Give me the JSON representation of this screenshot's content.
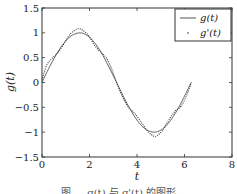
{
  "chart_data": {
    "type": "line",
    "title": "",
    "xlabel": "t",
    "ylabel": "g(t)",
    "xlim": [
      0,
      8
    ],
    "ylim": [
      -1.5,
      1.5
    ],
    "xticks": [
      0,
      2,
      4,
      6,
      8
    ],
    "xtick_labels": [
      "0",
      "2",
      "4",
      "6",
      "8"
    ],
    "yticks": [
      -1.5,
      -1,
      -0.5,
      0,
      0.5,
      1,
      1.5
    ],
    "ytick_labels": [
      "−1.5",
      "−1",
      "−0.5",
      "0",
      "0.5",
      "1",
      "1.5"
    ],
    "grid": false,
    "legend_position": "upper right",
    "series": [
      {
        "name": "g(t)",
        "style": "solid",
        "x": [
          0,
          0.3,
          0.6,
          0.9,
          1.2,
          1.5708,
          1.9,
          2.2,
          2.5,
          2.8,
          3.1416,
          3.5,
          3.8,
          4.1,
          4.4,
          4.7124,
          5.0,
          5.3,
          5.6,
          5.9,
          6.2832
        ],
        "values": [
          0,
          0.3,
          0.56,
          0.78,
          0.93,
          1.0,
          0.95,
          0.81,
          0.6,
          0.33,
          0,
          -0.35,
          -0.61,
          -0.82,
          -0.95,
          -1.0,
          -0.96,
          -0.83,
          -0.63,
          -0.37,
          0
        ]
      },
      {
        "name": "g'(t)",
        "style": "dotted",
        "x": [
          0,
          0.2,
          0.45,
          0.7,
          0.95,
          1.2,
          1.45,
          1.5708,
          1.7,
          1.95,
          2.2,
          2.45,
          2.7,
          2.95,
          3.1416,
          3.4,
          3.65,
          3.9,
          4.15,
          4.45,
          4.7124,
          4.85,
          5.1,
          5.35,
          5.6,
          5.85,
          6.1,
          6.2832
        ],
        "values": [
          0.05,
          0.35,
          0.5,
          0.62,
          0.8,
          0.98,
          1.07,
          1.08,
          1.06,
          0.95,
          0.76,
          0.62,
          0.5,
          0.25,
          0.0,
          -0.3,
          -0.5,
          -0.62,
          -0.78,
          -0.98,
          -1.08,
          -1.07,
          -0.95,
          -0.75,
          -0.58,
          -0.48,
          -0.25,
          0.0
        ]
      }
    ],
    "legend": [
      {
        "label": "g(t)",
        "marker": "line"
      },
      {
        "label": "g'(t)",
        "marker": "dot"
      }
    ],
    "caption": "图 … g(t) 与 g'(t) 的图形"
  },
  "colors": {
    "axis": "#333333",
    "series_solid": "#555555",
    "series_dotted": "#333333"
  }
}
